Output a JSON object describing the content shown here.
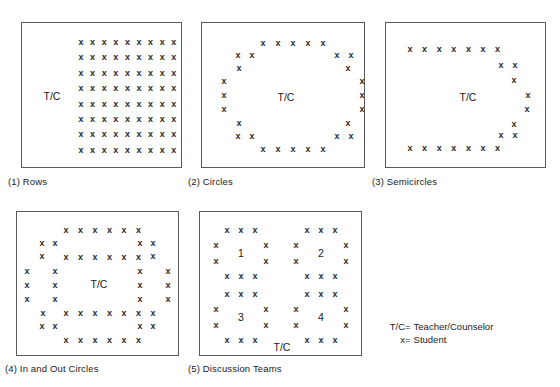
{
  "diagram": {
    "student_mark": "x",
    "teacher_label": "T/C",
    "legend": [
      {
        "key": "T/C",
        "eq": "=",
        "value": "Teacher/Counselor"
      },
      {
        "key": "x",
        "eq": "=",
        "value": "Student"
      }
    ]
  },
  "panels": [
    {
      "id": "rows",
      "caption": "(1) Rows",
      "teacher_label": "T/C",
      "layout": "grid",
      "rows": 8,
      "cols": 9,
      "student_count": 72
    },
    {
      "id": "circles",
      "caption": "(2) Circles",
      "teacher_label": "T/C",
      "layout": "ring",
      "student_count": 26
    },
    {
      "id": "semicircles",
      "caption": "(3) Semicircles",
      "teacher_label": "T/C",
      "layout": "semicircle",
      "student_count": 24
    },
    {
      "id": "in-and-out-circles",
      "caption": "(4) In and Out Circles",
      "teacher_label": "T/C",
      "layout": "double-ring",
      "student_count": 46
    },
    {
      "id": "discussion-teams",
      "caption": "(5) Discussion Teams",
      "teacher_label": "T/C",
      "layout": "four-groups",
      "groups": [
        "1",
        "2",
        "3",
        "4"
      ],
      "student_count": 40
    }
  ]
}
